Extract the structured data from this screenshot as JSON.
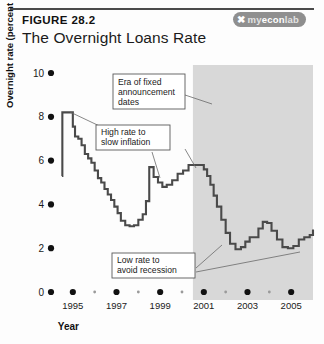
{
  "header": {
    "figure_number": "FIGURE 28.2",
    "title": "The Overnight Loans Rate",
    "logo": {
      "mark": "✖",
      "part1": "my",
      "part2": "econ",
      "part3": "lab",
      "full": "myeconlab"
    }
  },
  "annotations": [
    {
      "id": "era-fixed",
      "lines": [
        "Era of fixed",
        "announcement",
        "dates"
      ]
    },
    {
      "id": "high-rate",
      "lines": [
        "High rate to",
        "slow inflation"
      ]
    },
    {
      "id": "low-rate",
      "lines": [
        "Low rate to",
        "avoid recession"
      ]
    }
  ],
  "chart_data": {
    "type": "line",
    "title": "The Overnight Loans Rate",
    "xlabel": "Year",
    "ylabel": "Overnight rate (percent per year)",
    "xlim": [
      1994.0,
      2006.0
    ],
    "ylim": [
      0,
      10
    ],
    "yticks": [
      0,
      2,
      4,
      6,
      8,
      10
    ],
    "ytick_labels": [
      "0",
      "2",
      "4",
      "6",
      "8",
      "10"
    ],
    "xticks": [
      1995,
      1997,
      1999,
      2001,
      2003,
      2005
    ],
    "xtick_labels": [
      "1995",
      "1997",
      "1999",
      "2001",
      "2003",
      "2005"
    ],
    "xminor_ticks": [
      1996,
      1998,
      2000,
      2002,
      2004
    ],
    "grid": false,
    "legend": null,
    "line_color": "#4a4a4a",
    "shaded_region": {
      "label": "Era of fixed announcement dates",
      "x_start": 2000.5,
      "x_end": 2006.0,
      "color": "#d8d8d8"
    },
    "series": [
      {
        "name": "Overnight rate",
        "step": true,
        "x": [
          1994.5,
          1994.52,
          1994.75,
          1995.0,
          1995.1,
          1995.25,
          1995.4,
          1995.55,
          1995.7,
          1995.85,
          1996.0,
          1996.15,
          1996.3,
          1996.45,
          1996.6,
          1996.75,
          1996.9,
          1997.05,
          1997.2,
          1997.4,
          1997.6,
          1997.8,
          1998.0,
          1998.2,
          1998.35,
          1998.5,
          1998.7,
          1998.9,
          1999.1,
          1999.3,
          1999.55,
          1999.8,
          2000.05,
          2000.3,
          2000.55,
          2000.8,
          2001.0,
          2001.15,
          2001.3,
          2001.45,
          2001.6,
          2001.8,
          2002.0,
          2002.2,
          2002.45,
          2002.7,
          2002.9,
          2003.1,
          2003.3,
          2003.5,
          2003.7,
          2003.9,
          2004.1,
          2004.35,
          2004.6,
          2004.85,
          2005.1,
          2005.35,
          2005.6,
          2005.85,
          2006.0
        ],
        "y": [
          5.3,
          8.2,
          8.2,
          7.55,
          7.1,
          7.0,
          6.7,
          6.3,
          6.1,
          5.9,
          5.55,
          5.2,
          5.0,
          4.7,
          4.45,
          4.2,
          3.9,
          3.6,
          3.25,
          3.05,
          3.0,
          3.05,
          3.3,
          3.55,
          4.15,
          5.7,
          5.25,
          5.0,
          4.8,
          4.9,
          5.1,
          5.4,
          5.55,
          5.8,
          5.8,
          5.8,
          5.6,
          5.3,
          4.9,
          4.4,
          3.9,
          3.3,
          2.7,
          2.2,
          1.95,
          2.05,
          2.3,
          2.5,
          2.5,
          2.9,
          3.2,
          3.15,
          2.8,
          2.4,
          2.05,
          2.0,
          2.1,
          2.4,
          2.5,
          2.6,
          2.85
        ]
      }
    ]
  }
}
